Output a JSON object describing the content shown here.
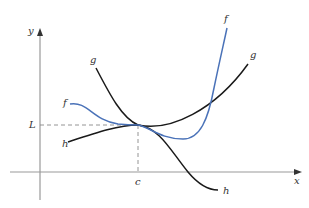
{
  "figure": {
    "axes": {
      "x_label": "x",
      "y_label": "y"
    },
    "markers": {
      "L_label": "L",
      "c_label": "c"
    },
    "curves": [
      {
        "name": "f",
        "color": "#4a72b8",
        "label_start": "f",
        "label_end": "f"
      },
      {
        "name": "g",
        "color": "#1a1a1a",
        "label_start": "g",
        "label_end": "g"
      },
      {
        "name": "h",
        "color": "#1a1a1a",
        "label_start": "h",
        "label_end": "h"
      }
    ]
  }
}
